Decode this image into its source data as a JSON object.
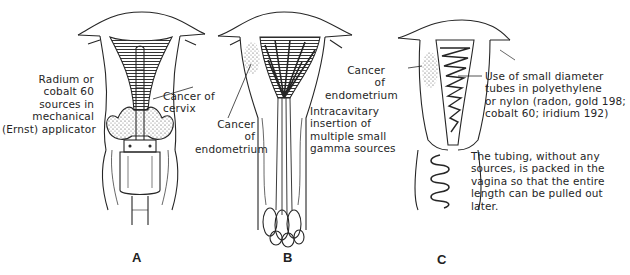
{
  "figure": {
    "panels": [
      {
        "id": "A",
        "label": "A",
        "annotations": [
          {
            "name": "applicator-label",
            "lines": [
              "Radium or",
              "cobalt 60",
              "sources in",
              "mechanical",
              "(Ernst) applicator"
            ]
          },
          {
            "name": "cervix-cancer-label",
            "lines": [
              "Cancer of",
              "cervix"
            ]
          }
        ]
      },
      {
        "id": "B",
        "label": "B",
        "annotations": [
          {
            "name": "endometrium-cancer-label",
            "lines": [
              "Cancer",
              "of",
              "endometrium"
            ]
          },
          {
            "name": "intracavitary-label",
            "lines": [
              "Intracavitary",
              "insertion of",
              "multiple small",
              "gamma sources"
            ]
          }
        ]
      },
      {
        "id": "C",
        "label": "C",
        "annotations": [
          {
            "name": "endometrium-cancer-label",
            "lines": [
              "Cancer",
              "of",
              "endometrium"
            ]
          },
          {
            "name": "tubes-label",
            "lines": [
              "Use of small diameter",
              "tubes in polyethylene",
              "or nylon (radon, gold 198;",
              "cobalt 60; iridium 192)"
            ]
          },
          {
            "name": "tubing-label",
            "lines": [
              "The tubing, without any",
              "sources, is packed in the",
              "vagina so that the entire",
              "length can be pulled out",
              "later."
            ]
          }
        ]
      }
    ],
    "colors": {
      "ink": "#262626",
      "background": "#ffffff"
    }
  }
}
